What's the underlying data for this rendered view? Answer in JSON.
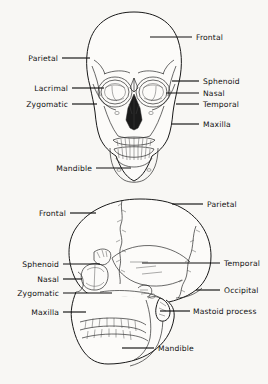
{
  "figure": {
    "background_color": "#f8f7f4",
    "ink_color": "#1a1a1a"
  },
  "views": [
    {
      "name": "anterior-skull",
      "labels": [
        {
          "id": "frontal",
          "text": "Frontal",
          "side": "right",
          "text_x": 196,
          "text_y": 40,
          "line_x1": 150,
          "line_x2": 192,
          "line_y": 37
        },
        {
          "id": "parietal",
          "text": "Parietal",
          "side": "left",
          "text_x": 58,
          "text_y": 61,
          "line_x1": 62,
          "line_x2": 90,
          "line_y": 58
        },
        {
          "id": "sphenoid",
          "text": "Sphenoid",
          "side": "right",
          "text_x": 203,
          "text_y": 84,
          "line_x1": 172,
          "line_x2": 199,
          "line_y": 81
        },
        {
          "id": "lacrimal",
          "text": "Lacrimal",
          "side": "left",
          "text_x": 68,
          "text_y": 91,
          "line_x1": 72,
          "line_x2": 104,
          "line_y": 88
        },
        {
          "id": "nasal",
          "text": "Nasal",
          "side": "right",
          "text_x": 203,
          "text_y": 96,
          "line_x1": 166,
          "line_x2": 199,
          "line_y": 93
        },
        {
          "id": "zygomatic",
          "text": "Zygomatic",
          "side": "left",
          "text_x": 68,
          "text_y": 107,
          "line_x1": 72,
          "line_x2": 97,
          "line_y": 104
        },
        {
          "id": "temporal",
          "text": "Temporal",
          "side": "right",
          "text_x": 203,
          "text_y": 107,
          "line_x1": 176,
          "line_x2": 199,
          "line_y": 104
        },
        {
          "id": "maxilla",
          "text": "Maxilla",
          "side": "right",
          "text_x": 203,
          "text_y": 127,
          "line_x1": 172,
          "line_x2": 199,
          "line_y": 124
        },
        {
          "id": "mandible",
          "text": "Mandible",
          "side": "left",
          "text_x": 92,
          "text_y": 171,
          "line_x1": 96,
          "line_x2": 131,
          "line_y": 168
        }
      ]
    },
    {
      "name": "lateral-skull",
      "labels": [
        {
          "id": "parietal",
          "text": "Parietal",
          "side": "right",
          "text_x": 207,
          "text_y": 207,
          "line_x1": 172,
          "line_x2": 203,
          "line_y": 204
        },
        {
          "id": "frontal",
          "text": "Frontal",
          "side": "left",
          "text_x": 66,
          "text_y": 216,
          "line_x1": 70,
          "line_x2": 96,
          "line_y": 213
        },
        {
          "id": "temporal",
          "text": "Temporal",
          "side": "right",
          "text_x": 224,
          "text_y": 266,
          "line_x1": 142,
          "line_x2": 220,
          "line_y": 263
        },
        {
          "id": "sphenoid",
          "text": "Sphenoid",
          "side": "left",
          "text_x": 59,
          "text_y": 267,
          "line_x1": 63,
          "line_x2": 100,
          "line_y": 264
        },
        {
          "id": "nasal",
          "text": "Nasal",
          "side": "left",
          "text_x": 59,
          "text_y": 282,
          "line_x1": 63,
          "line_x2": 82,
          "line_y": 279
        },
        {
          "id": "occipital",
          "text": "Occipital",
          "side": "right",
          "text_x": 224,
          "text_y": 293,
          "line_x1": 196,
          "line_x2": 220,
          "line_y": 290
        },
        {
          "id": "zygomatic",
          "text": "Zygomatic",
          "side": "left",
          "text_x": 59,
          "text_y": 296,
          "line_x1": 63,
          "line_x2": 112,
          "line_y": 293
        },
        {
          "id": "mastoid-process",
          "text": "Mastoid process",
          "side": "right",
          "text_x": 193,
          "text_y": 314,
          "line_x1": 160,
          "line_x2": 190,
          "line_y": 311
        },
        {
          "id": "maxilla",
          "text": "Maxilla",
          "side": "left",
          "text_x": 59,
          "text_y": 315,
          "line_x1": 63,
          "line_x2": 86,
          "line_y": 312
        },
        {
          "id": "mandible",
          "text": "Mandible",
          "side": "right",
          "text_x": 158,
          "text_y": 351,
          "line_x1": 122,
          "line_x2": 154,
          "line_y": 348
        }
      ]
    }
  ]
}
